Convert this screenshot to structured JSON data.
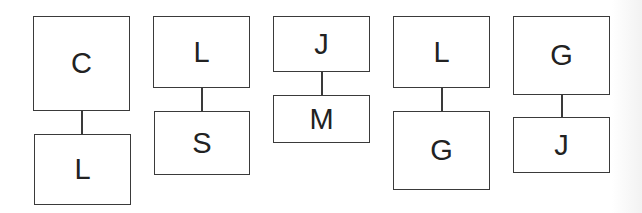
{
  "diagram": {
    "pairs": [
      {
        "top": "C",
        "bottom": "L"
      },
      {
        "top": "L",
        "bottom": "S"
      },
      {
        "top": "J",
        "bottom": "M"
      },
      {
        "top": "L",
        "bottom": "G"
      },
      {
        "top": "G",
        "bottom": "J"
      }
    ]
  },
  "colors": {
    "stroke": "#3a3a3a",
    "text": "#222222",
    "background": "#ffffff"
  }
}
